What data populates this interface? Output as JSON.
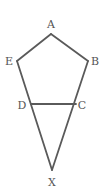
{
  "diagram": {
    "type": "geometry",
    "stroke_color": "#5a5a5a",
    "points": {
      "A": {
        "label": "A",
        "x": 51,
        "y": 34
      },
      "B": {
        "label": "B",
        "x": 88,
        "y": 61
      },
      "C": {
        "label": "C",
        "x": 76,
        "y": 104
      },
      "D": {
        "label": "D",
        "x": 31,
        "y": 104
      },
      "E": {
        "label": "E",
        "x": 17,
        "y": 61
      },
      "X": {
        "label": "X",
        "x": 52,
        "y": 170
      }
    },
    "segments": [
      "AB",
      "BC",
      "CD",
      "AE",
      "ED",
      "DX",
      "CX"
    ],
    "labels": {
      "A": "A",
      "B": "B",
      "C": "C",
      "D": "D",
      "E": "E",
      "X": "X"
    }
  }
}
